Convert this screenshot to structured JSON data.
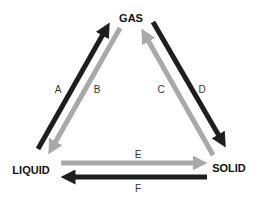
{
  "diagram": {
    "type": "phase-change-triangle",
    "colors": {
      "dark": "#1e1e1e",
      "light": "#a9a9a9",
      "background": "#ffffff"
    },
    "states": {
      "gas": {
        "label": "GAS"
      },
      "liquid": {
        "label": "LIQUID"
      },
      "solid": {
        "label": "SOLID"
      }
    },
    "arrows": [
      {
        "id": "A",
        "label": "A",
        "from": "LIQUID",
        "to": "GAS",
        "shade": "dark"
      },
      {
        "id": "B",
        "label": "B",
        "from": "GAS",
        "to": "LIQUID",
        "shade": "light"
      },
      {
        "id": "C",
        "label": "C",
        "from": "SOLID",
        "to": "GAS",
        "shade": "light"
      },
      {
        "id": "D",
        "label": "D",
        "from": "GAS",
        "to": "SOLID",
        "shade": "dark"
      },
      {
        "id": "E",
        "label": "E",
        "from": "LIQUID",
        "to": "SOLID",
        "shade": "light"
      },
      {
        "id": "F",
        "label": "F",
        "from": "SOLID",
        "to": "LIQUID",
        "shade": "dark"
      }
    ]
  }
}
